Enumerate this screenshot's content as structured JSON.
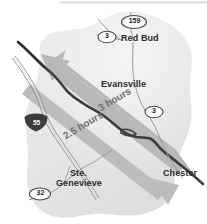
{
  "map": {
    "title": "Regional road map: Mississippi River crossings",
    "colors": {
      "background": "#ffffff",
      "land": "#e8e8e8",
      "land_shadow": "#dcdcdc",
      "arrow": "#b4b4b4",
      "arrow_label_text": "#6e6e6e",
      "river": "#3a3a3a",
      "road": "#9a9a9a",
      "shield_fill": "#fbfbfb",
      "shield_stroke": "#4a4a4a",
      "interstate_fill": "#3c3c3c",
      "city_text": "#2a2a2a"
    },
    "top_rule": true,
    "cities": [
      {
        "name": "Red Bud",
        "x": 122,
        "y": 40,
        "align": "left"
      },
      {
        "name": "Evansville",
        "x": 103,
        "y": 86,
        "align": "left"
      },
      {
        "name": "Ste.",
        "x": 70,
        "y": 175,
        "align": "left"
      },
      {
        "name": "Genevieve",
        "x": 57,
        "y": 185,
        "align": "left"
      },
      {
        "name": "Chester",
        "x": 164,
        "y": 174,
        "align": "left"
      }
    ],
    "route_shields": [
      {
        "number": "159",
        "type": "state",
        "x": 134,
        "y": 22
      },
      {
        "number": "3",
        "type": "state",
        "x": 107,
        "y": 37
      },
      {
        "number": "3",
        "type": "state",
        "x": 154,
        "y": 112
      },
      {
        "number": "32",
        "type": "state",
        "x": 40,
        "y": 194
      },
      {
        "number": "55",
        "type": "interstate",
        "x": 36,
        "y": 122
      }
    ],
    "travel_arrows": [
      {
        "label": "3 hours",
        "direction": "northwest",
        "x": 101,
        "y": 110,
        "rotation": -31
      },
      {
        "label": "2.5 hours",
        "direction": "southeast",
        "x": 68,
        "y": 135,
        "rotation": -31
      }
    ],
    "features": {
      "river_name": "Mississippi River",
      "landmass": "shaded land area",
      "interstate_label": "I-55"
    }
  }
}
